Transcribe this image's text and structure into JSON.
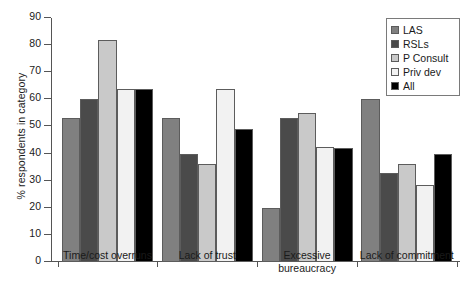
{
  "chart_data": {
    "type": "bar",
    "title": "",
    "xlabel": "",
    "ylabel": "% respondents in category",
    "ylim": [
      0,
      90
    ],
    "ytick_step": 10,
    "grid": false,
    "legend_position": "top-right",
    "categories": [
      "Time/cost overruns",
      "Lack of trust",
      "Excessive\nbureaucracy",
      "Lack of commitment"
    ],
    "ytick_labels": [
      "0",
      "10",
      "20",
      "30",
      "40",
      "50",
      "60",
      "70",
      "80",
      "90"
    ],
    "series": [
      {
        "name": "LAS",
        "color": "#808080",
        "values": [
          53,
          53,
          20,
          60
        ]
      },
      {
        "name": "RSLs",
        "color": "#4a4a4a",
        "values": [
          60,
          40,
          53,
          33
        ]
      },
      {
        "name": "P Consult",
        "color": "#c9c9c9",
        "values": [
          82,
          36,
          55,
          36
        ]
      },
      {
        "name": "Priv dev",
        "color": "#f2f2f2",
        "values": [
          64,
          64,
          42.5,
          28.5
        ]
      },
      {
        "name": "All",
        "color": "#000000",
        "values": [
          64,
          49,
          42,
          40
        ]
      }
    ]
  }
}
